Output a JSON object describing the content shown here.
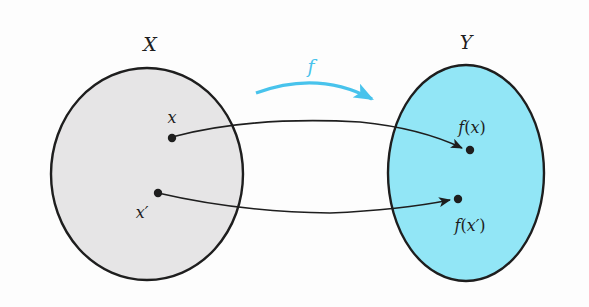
{
  "diagram": {
    "type": "function-mapping",
    "colors": {
      "background": "#fdfdfd",
      "domain_fill": "#e6e5e6",
      "codomain_fill": "#92e6f6",
      "outline": "#1e1e1e",
      "mapping_arrow": "#48c3ec",
      "label_f": "#48c3ec"
    },
    "domain": {
      "label": "X",
      "points": [
        {
          "label": "x"
        },
        {
          "label": "x′"
        }
      ]
    },
    "codomain": {
      "label": "Y",
      "points": [
        {
          "label_func": "f",
          "label_open": "(",
          "label_arg": "x",
          "label_close": ")"
        },
        {
          "label_func": "f",
          "label_open": "(",
          "label_arg": "x′",
          "label_close": ")"
        }
      ]
    },
    "function": {
      "label": "f"
    },
    "edges": [
      {
        "from": "x",
        "to": "f(x)"
      },
      {
        "from": "x′",
        "to": "f(x′)"
      }
    ]
  }
}
